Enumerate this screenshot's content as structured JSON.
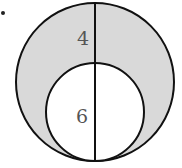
{
  "figure": {
    "bullet": "•",
    "labels": {
      "outer_segment": "4",
      "inner_diameter": "6"
    },
    "colors": {
      "shaded_region": "#d9d9d9",
      "inner_fill": "#ffffff",
      "stroke": "#111111"
    },
    "geometry": {
      "outer_circle": {
        "cx": 95,
        "cy": 82,
        "r": 79
      },
      "inner_circle": {
        "cx": 95,
        "cy": 112,
        "r": 49
      },
      "diameter_line": {
        "x": 95,
        "y1": 3,
        "y2": 161
      }
    }
  }
}
